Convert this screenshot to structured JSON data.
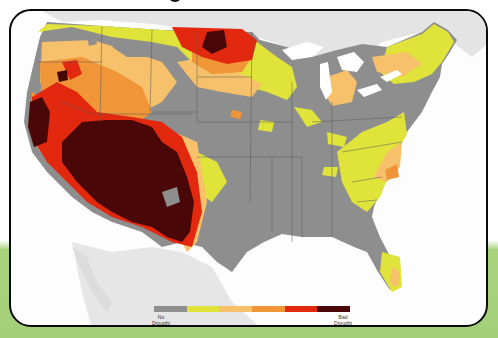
{
  "map": {
    "subject": "US drought conditions",
    "colors": {
      "background_sea": "#fdfdfd",
      "neighbor_land": "#e4e4e4",
      "no_drought": "#8e8e8e",
      "level_1": "#dfe33a",
      "level_2": "#f7c06a",
      "level_3": "#f19638",
      "level_4": "#e2280f",
      "level_5": "#4a0707",
      "state_border": "#5a5a5a",
      "lakes": "#ffffff"
    }
  },
  "legend": {
    "segments": [
      {
        "name": "no-drought",
        "color": "#8e8e8e"
      },
      {
        "name": "abnormally-dry",
        "color": "#dfe33a"
      },
      {
        "name": "moderate",
        "color": "#f7c06a"
      },
      {
        "name": "severe",
        "color": "#f19638"
      },
      {
        "name": "extreme",
        "color": "#e2280f"
      },
      {
        "name": "exceptional",
        "color": "#4a0707"
      }
    ],
    "left_label_line1": "No",
    "left_label_line2": "Drought",
    "right_label_line1": "Bad",
    "right_label_line2": "Drought"
  },
  "page": {
    "background_top": "#ffffff",
    "background_bottom": "#a4cf7a",
    "card_border": "#0a0a0a"
  }
}
